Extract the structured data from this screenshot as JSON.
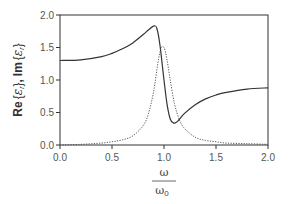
{
  "chart_data": {
    "type": "line",
    "title": "",
    "xlabel": "ω / ω0",
    "ylabel": "Re{εr}, Im{εr}",
    "xlim": [
      0,
      2
    ],
    "ylim": [
      0,
      2
    ],
    "x_ticks": [
      "0.0",
      "0.5",
      "1.0",
      "1.5",
      "2.0"
    ],
    "y_ticks": [
      "0.0",
      "0.5",
      "1.0",
      "1.5",
      "2.0"
    ],
    "grid": false,
    "legend": null,
    "series": [
      {
        "name": "Re{εr}",
        "style": "solid",
        "x": [
          0.0,
          0.2,
          0.4,
          0.5,
          0.6,
          0.7,
          0.8,
          0.85,
          0.9,
          0.93,
          0.96,
          1.0,
          1.03,
          1.06,
          1.09,
          1.12,
          1.15,
          1.2,
          1.3,
          1.4,
          1.5,
          1.6,
          1.8,
          2.0
        ],
        "values": [
          1.3,
          1.31,
          1.36,
          1.41,
          1.48,
          1.57,
          1.7,
          1.77,
          1.83,
          1.8,
          1.55,
          1.0,
          0.62,
          0.4,
          0.34,
          0.35,
          0.4,
          0.49,
          0.62,
          0.71,
          0.77,
          0.81,
          0.86,
          0.88
        ]
      },
      {
        "name": "Im{εr}",
        "style": "dotted",
        "x": [
          0.0,
          0.2,
          0.4,
          0.5,
          0.6,
          0.7,
          0.8,
          0.85,
          0.9,
          0.94,
          0.97,
          1.0,
          1.03,
          1.06,
          1.1,
          1.15,
          1.2,
          1.3,
          1.4,
          1.5,
          1.6,
          1.8,
          2.0
        ],
        "values": [
          0.0,
          0.01,
          0.03,
          0.05,
          0.08,
          0.14,
          0.3,
          0.48,
          0.82,
          1.25,
          1.48,
          1.5,
          1.3,
          1.0,
          0.64,
          0.38,
          0.25,
          0.12,
          0.07,
          0.05,
          0.03,
          0.02,
          0.01
        ]
      }
    ]
  },
  "axes": {
    "ylabel_re": "Re",
    "ylabel_im": "Im",
    "ylabel_sep": ",",
    "eps_symbol": "ε",
    "eps_sub": "r",
    "xlabel_num": "ω",
    "xlabel_den": "ω",
    "xlabel_den_sub": "0"
  }
}
